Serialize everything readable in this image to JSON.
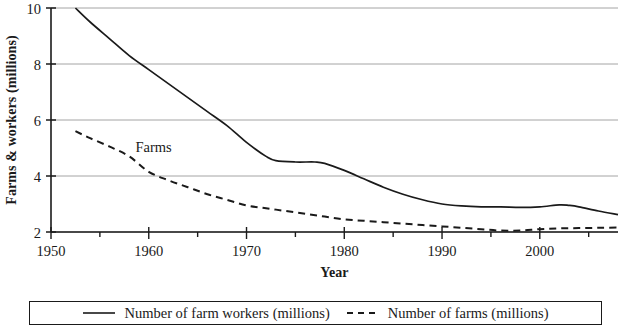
{
  "chart_data": {
    "type": "line",
    "title": "",
    "xlabel": "Year",
    "ylabel": "Farms & workers (millions)",
    "xlim": [
      1950,
      2008
    ],
    "ylim": [
      2,
      10
    ],
    "xticks": [
      1950,
      1960,
      1970,
      1980,
      1990,
      2000
    ],
    "xtick_labels": [
      "1950",
      "1960",
      "1970",
      "1980",
      "1990",
      "2000"
    ],
    "xminor_step": 5,
    "yticks": [
      2,
      4,
      6,
      8,
      10
    ],
    "ytick_labels": [
      "2",
      "4",
      "6",
      "8",
      "10"
    ],
    "grid": "horizontal",
    "legend_position": "below",
    "annotations": [
      {
        "text": "Farms",
        "x": 1960.5,
        "y": 4.85
      }
    ],
    "series": [
      {
        "name": "Number of farm workers (millions)",
        "legend_label": "Number of farm workers (millions)",
        "style": "solid",
        "color": "#1a1a1a",
        "x": [
          1952.5,
          1954,
          1956,
          1958,
          1960,
          1962,
          1964,
          1966,
          1968,
          1970,
          1972,
          1973,
          1975,
          1977,
          1978,
          1980,
          1982,
          1984,
          1986,
          1988,
          1990,
          1992,
          1994,
          1996,
          1998,
          2000,
          2002,
          2003,
          2004,
          2006,
          2008
        ],
        "values": [
          10.0,
          9.5,
          8.9,
          8.3,
          7.8,
          7.3,
          6.8,
          6.3,
          5.8,
          5.2,
          4.7,
          4.55,
          4.5,
          4.5,
          4.45,
          4.2,
          3.9,
          3.6,
          3.35,
          3.15,
          3.0,
          2.93,
          2.9,
          2.9,
          2.88,
          2.9,
          2.97,
          2.95,
          2.9,
          2.75,
          2.62
        ]
      },
      {
        "name": "Number of farms (millions)",
        "legend_label": "Number of farms (millions)",
        "style": "dashed",
        "color": "#1a1a1a",
        "x": [
          1952.5,
          1954,
          1956,
          1958,
          1960,
          1962,
          1964,
          1966,
          1968,
          1970,
          1972,
          1974,
          1976,
          1978,
          1980,
          1982,
          1984,
          1986,
          1988,
          1990,
          1992,
          1994,
          1996,
          1998,
          2000,
          2002,
          2004,
          2006,
          2008
        ],
        "values": [
          5.6,
          5.35,
          5.05,
          4.7,
          4.15,
          3.85,
          3.6,
          3.35,
          3.15,
          2.95,
          2.85,
          2.75,
          2.65,
          2.55,
          2.45,
          2.4,
          2.35,
          2.3,
          2.25,
          2.2,
          2.15,
          2.1,
          2.05,
          2.05,
          2.1,
          2.13,
          2.14,
          2.15,
          2.16
        ]
      }
    ]
  }
}
